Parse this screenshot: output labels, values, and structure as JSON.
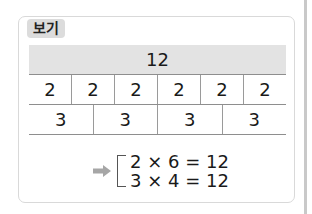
{
  "tag_label": "보기",
  "table": {
    "total": "12",
    "row_twos": [
      "2",
      "2",
      "2",
      "2",
      "2",
      "2"
    ],
    "row_threes": [
      "3",
      "3",
      "3",
      "3"
    ]
  },
  "result": {
    "arrow_icon": "right-arrow-icon",
    "equations": [
      "2 × 6 = 12",
      "3 × 4 = 12"
    ]
  },
  "colors": {
    "header_band": "#e3e3e3",
    "tag_bg": "#dcdcdc",
    "arrow": "#a6a6a6",
    "card_border": "#d9d9d9"
  }
}
